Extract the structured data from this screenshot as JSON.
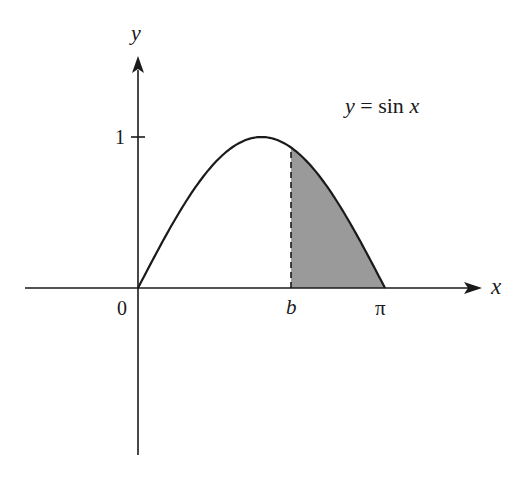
{
  "diagram": {
    "title": "",
    "axes": {
      "x_label": "x",
      "y_label": "y",
      "origin_label": "0",
      "y_tick_label": "1",
      "x_tick_labels": {
        "b": "b",
        "pi": "π"
      }
    },
    "curve": {
      "label": "y = sin x",
      "label_parts": {
        "lhs": "y",
        "eq": " = ",
        "fn": "sin ",
        "var": "x"
      },
      "function": "sin x",
      "domain": [
        0,
        3.14159
      ]
    },
    "shaded_region": {
      "description": "Area under y = sin x from x = b to x = π",
      "from": "b",
      "to": "π",
      "fill_color": "#9a9a9a",
      "boundary_style": "dashed"
    },
    "colors": {
      "stroke": "#1a1a1a",
      "background": "#ffffff",
      "shade": "#9a9a9a"
    }
  }
}
